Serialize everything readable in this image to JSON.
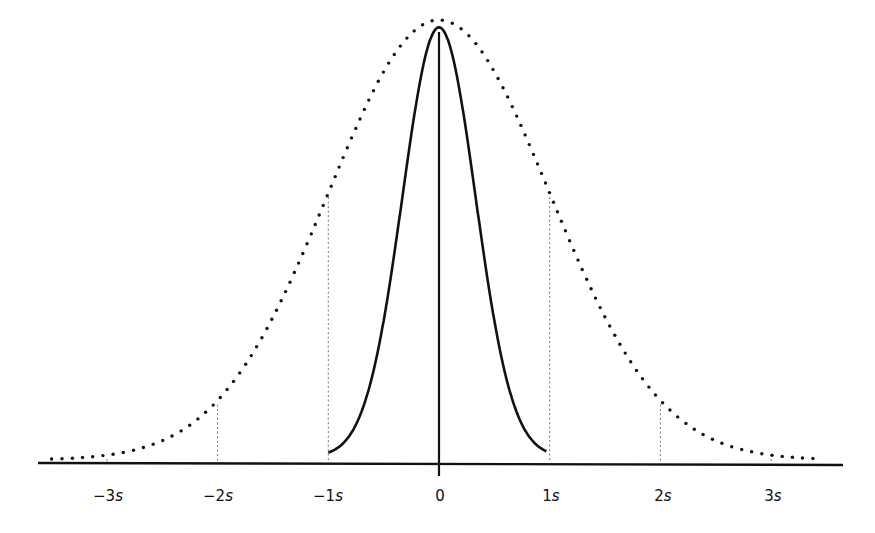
{
  "chart_data": {
    "type": "line",
    "title": "",
    "xlabel": "",
    "ylabel": "",
    "x_ticks": [
      "−3s",
      "−2s",
      "−1s",
      "0",
      "1s",
      "2s",
      "3s"
    ],
    "x_tick_values": [
      -3,
      -2,
      -1,
      0,
      1,
      2,
      3
    ],
    "xlim": [
      -3.6,
      3.65
    ],
    "grid": false,
    "legend": null,
    "series": [
      {
        "name": "wide-distribution",
        "style": "dotted",
        "description": "Normal curve with standard deviation s (1 unit)",
        "sigma": 1.0,
        "x_range": [
          -3.5,
          3.45
        ],
        "peak": 1.0
      },
      {
        "name": "narrow-distribution",
        "style": "solid",
        "description": "Narrow peaked curve, same peak height, confined to ±1s",
        "sigma": 0.33,
        "x_range": [
          -1.0,
          0.97
        ],
        "peak": 0.99
      }
    ],
    "reference_lines": [
      {
        "x": -3,
        "style": "dashed",
        "to": "wide-distribution"
      },
      {
        "x": -2,
        "style": "dashed",
        "to": "wide-distribution"
      },
      {
        "x": -1,
        "style": "dashed",
        "to": "wide-distribution"
      },
      {
        "x": 1,
        "style": "dashed",
        "to": "wide-distribution"
      },
      {
        "x": 2,
        "style": "dashed",
        "to": "wide-distribution"
      },
      {
        "x": 3,
        "style": "dashed",
        "to": "wide-distribution"
      }
    ]
  },
  "labels": {
    "tick_m3": "−3",
    "tick_m2": "−2",
    "tick_m1": "−1",
    "tick_0": "0",
    "tick_p1": "1",
    "tick_p2": "2",
    "tick_p3": "3",
    "unit": "s"
  }
}
